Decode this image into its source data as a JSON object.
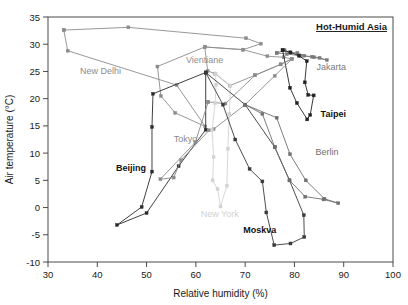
{
  "chart_data": {
    "type": "line",
    "title": "Hot-Humid Asia",
    "xlabel": "Relative humidity (%)",
    "ylabel": "Air temperature (°C)",
    "xlim": [
      30,
      100
    ],
    "ylim": [
      -10,
      35
    ],
    "xticks": [
      30,
      40,
      50,
      60,
      70,
      80,
      90,
      100
    ],
    "yticks": [
      -10,
      -5,
      0,
      5,
      10,
      15,
      20,
      25,
      30,
      35
    ],
    "grid": false,
    "legend": "inline-annotations",
    "marker": "square",
    "series": [
      {
        "name": "New Delhi",
        "color": "#8c8c8c",
        "label_bold": false,
        "label_x": 36.5,
        "label_y": 24.6,
        "points": [
          [
            33.2,
            32.6
          ],
          [
            46.3,
            33.1
          ],
          [
            70.2,
            31.1
          ],
          [
            73.2,
            30.1
          ],
          [
            69.6,
            29.0
          ],
          [
            61.8,
            29.5
          ],
          [
            52.2,
            25.9
          ],
          [
            52.9,
            20.5
          ],
          [
            55.8,
            17.4
          ],
          [
            61.9,
            14.9
          ],
          [
            56.1,
            22.5
          ],
          [
            34.0,
            28.8
          ],
          [
            33.2,
            32.6
          ]
        ]
      },
      {
        "name": "Vientiane",
        "color": "#8f8f8f",
        "label_bold": false,
        "label_x": 58.0,
        "label_y": 26.6,
        "points": [
          [
            61.8,
            29.5
          ],
          [
            69.6,
            29.0
          ],
          [
            74.5,
            27.8
          ],
          [
            77.8,
            27.6
          ],
          [
            79.5,
            27.3
          ],
          [
            77.2,
            26.3
          ],
          [
            72.0,
            24.3
          ],
          [
            66.9,
            22.4
          ],
          [
            63.9,
            24.6
          ],
          [
            62.4,
            25.1
          ],
          [
            61.8,
            29.5
          ]
        ]
      },
      {
        "name": "Jakarta",
        "color": "#7a7a7a",
        "label_bold": false,
        "label_x": 84.5,
        "label_y": 25.3,
        "points": [
          [
            76.4,
            28.4
          ],
          [
            78.0,
            28.9
          ],
          [
            79.1,
            28.5
          ],
          [
            80.6,
            28.4
          ],
          [
            82.0,
            27.9
          ],
          [
            83.6,
            27.7
          ],
          [
            85.1,
            27.5
          ],
          [
            86.6,
            27.1
          ],
          [
            84.0,
            27.6
          ],
          [
            81.2,
            27.9
          ],
          [
            78.5,
            28.2
          ],
          [
            76.4,
            28.4
          ]
        ]
      },
      {
        "name": "Taipei",
        "color": "#222222",
        "label_bold": true,
        "label_x": 85.3,
        "label_y": 16.6,
        "points": [
          [
            77.6,
            28.9
          ],
          [
            79.2,
            28.5
          ],
          [
            80.9,
            27.9
          ],
          [
            82.5,
            26.9
          ],
          [
            82.1,
            23.0
          ],
          [
            82.8,
            20.7
          ],
          [
            83.9,
            20.6
          ],
          [
            83.2,
            17.0
          ],
          [
            82.6,
            16.2
          ],
          [
            80.5,
            19.2
          ],
          [
            79.1,
            22.0
          ],
          [
            77.6,
            28.9
          ]
        ]
      },
      {
        "name": "Beijing",
        "color": "#2b2b2b",
        "label_bold": true,
        "label_x": 43.8,
        "label_y": 6.8,
        "points": [
          [
            62.0,
            24.8
          ],
          [
            51.3,
            20.9
          ],
          [
            51.1,
            14.8
          ],
          [
            51.1,
            6.6
          ],
          [
            49.0,
            0.1
          ],
          [
            44.0,
            -3.2
          ],
          [
            50.0,
            -1.0
          ],
          [
            56.5,
            7.6
          ],
          [
            62.0,
            14.3
          ],
          [
            62.0,
            24.8
          ]
        ]
      },
      {
        "name": "Tokyo",
        "color": "#8a8a8a",
        "label_bold": false,
        "label_x": 55.5,
        "label_y": 12.0,
        "points": [
          [
            62.5,
            19.4
          ],
          [
            66.0,
            19.1
          ],
          [
            72.0,
            24.3
          ],
          [
            77.2,
            26.3
          ],
          [
            79.5,
            27.3
          ],
          [
            76.0,
            24.2
          ],
          [
            70.0,
            18.9
          ],
          [
            63.6,
            14.4
          ],
          [
            62.7,
            14.2
          ],
          [
            57.0,
            8.7
          ],
          [
            55.5,
            5.5
          ],
          [
            52.8,
            5.2
          ],
          [
            59.9,
            12.0
          ],
          [
            62.5,
            19.4
          ]
        ]
      },
      {
        "name": "New York",
        "color": "#d2d2d2",
        "label_bold": false,
        "label_x": 61.0,
        "label_y": -1.8,
        "points": [
          [
            64.0,
            24.6
          ],
          [
            64.1,
            22.5
          ],
          [
            63.9,
            19.2
          ],
          [
            63.3,
            14.2
          ],
          [
            63.6,
            9.3
          ],
          [
            63.4,
            5.0
          ],
          [
            64.4,
            3.4
          ],
          [
            65.0,
            0.2
          ],
          [
            66.3,
            4.0
          ],
          [
            66.5,
            10.8
          ],
          [
            66.8,
            17.2
          ],
          [
            67.0,
            22.4
          ],
          [
            64.0,
            24.6
          ]
        ]
      },
      {
        "name": "Moskva",
        "color": "#3a3a3a",
        "label_bold": true,
        "label_x": 69.6,
        "label_y": -4.6,
        "points": [
          [
            62.0,
            24.8
          ],
          [
            65.5,
            18.9
          ],
          [
            68.0,
            12.5
          ],
          [
            70.9,
            7.1
          ],
          [
            73.5,
            4.8
          ],
          [
            74.3,
            -0.9
          ],
          [
            75.9,
            -6.9
          ],
          [
            79.2,
            -6.6
          ],
          [
            82.0,
            -5.4
          ],
          [
            81.9,
            -1.4
          ],
          [
            79.0,
            5.0
          ],
          [
            76.0,
            11.1
          ],
          [
            70.0,
            18.9
          ],
          [
            62.0,
            24.8
          ]
        ]
      },
      {
        "name": "Berlin",
        "color": "#6f6f6f",
        "label_bold": false,
        "label_x": 84.3,
        "label_y": 9.7,
        "points": [
          [
            70.0,
            18.9
          ],
          [
            73.5,
            17.2
          ],
          [
            76.0,
            11.1
          ],
          [
            79.0,
            5.0
          ],
          [
            82.2,
            2.0
          ],
          [
            85.9,
            1.5
          ],
          [
            88.9,
            0.8
          ],
          [
            86.1,
            1.6
          ],
          [
            82.3,
            5.0
          ],
          [
            79.1,
            9.8
          ],
          [
            76.4,
            16.5
          ],
          [
            70.0,
            18.9
          ]
        ]
      }
    ]
  }
}
